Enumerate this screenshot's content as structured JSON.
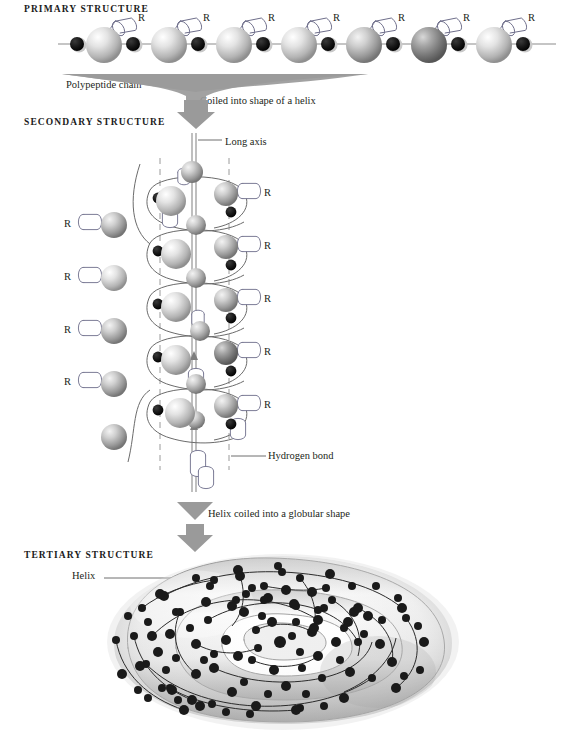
{
  "figure": {
    "title_primary": "PRIMARY STRUCTURE",
    "title_secondary": "SECONDARY STRUCTURE",
    "title_tertiary": "TERTIARY STRUCTURE",
    "annotations": {
      "polypeptide_chain": "Polypeptide chain",
      "coiled_into_helix": "Coiled into shape of a helix",
      "long_axis": "Long axis",
      "hydrogen_bond": "Hydrogen bond",
      "helix_coiled_globular": "Helix coiled into a globular shape",
      "helix": "Helix"
    },
    "r_group_label": "R",
    "colors": {
      "arrow_gray": "#8e8e8e",
      "sphere_light": "#e9e9e9",
      "sphere_mid": "#b9b9b9",
      "sphere_dark": "#6f6f6f",
      "atom_black": "#111111",
      "line_gray": "#6b6b6b",
      "dash_gray": "#9a9a9a",
      "text": "#231f20",
      "tube_light": "#f2f2f2",
      "tube_shadow": "#9c9c9c"
    }
  },
  "primary": {
    "r_group_count": 7,
    "residue_count": 7,
    "atom_dot_count": 8,
    "residues": [
      {
        "cx": 102,
        "tone": "light"
      },
      {
        "cx": 167,
        "tone": "light"
      },
      {
        "cx": 232,
        "tone": "light"
      },
      {
        "cx": 297,
        "tone": "light"
      },
      {
        "cx": 362,
        "tone": "mid"
      },
      {
        "cx": 427,
        "tone": "dark"
      },
      {
        "cx": 492,
        "tone": "light"
      }
    ],
    "atoms": [
      78,
      134,
      199,
      264,
      329,
      394,
      459,
      524
    ]
  },
  "secondary": {
    "turn_count": 5,
    "left_r_labels": [
      {
        "x": 64,
        "y": 216
      },
      {
        "x": 64,
        "y": 269
      },
      {
        "x": 64,
        "y": 322
      },
      {
        "x": 64,
        "y": 374
      }
    ],
    "right_r_labels": [
      {
        "x": 267,
        "y": 185
      },
      {
        "x": 267,
        "y": 238
      },
      {
        "x": 267,
        "y": 291
      },
      {
        "x": 267,
        "y": 344
      },
      {
        "x": 267,
        "y": 397
      }
    ],
    "dashed_lines_x": [
      160,
      229
    ],
    "axis_x": 194
  },
  "tertiary": {
    "node_count": 118,
    "helix_label_x": 72,
    "helix_label_y": 576
  }
}
